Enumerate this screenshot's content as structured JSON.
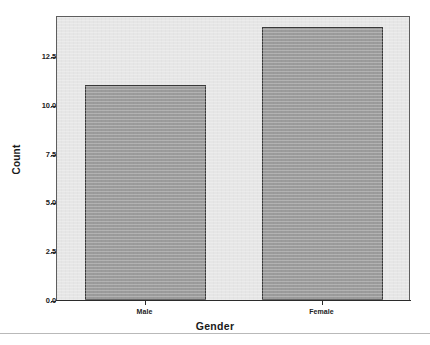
{
  "chart_data": {
    "type": "bar",
    "title": "",
    "subtitle": "",
    "categories": [
      "Male",
      "Female"
    ],
    "values": [
      11,
      14
    ],
    "xlabel": "Gender",
    "ylabel": "Count",
    "ylim": [
      0.0,
      14.6
    ],
    "yticks": [
      0.0,
      2.5,
      5.0,
      7.5,
      10.0,
      12.5
    ],
    "ytick_labels": [
      "0.0",
      "2.5",
      "5.0",
      "7.5",
      "10.0",
      "12.5"
    ],
    "grid": false,
    "legend": null,
    "annotations": [],
    "colors": {
      "bar_fill": "#9b9b9b",
      "bar_border": "#3a3a3a",
      "plot_background": "#e6e6e6",
      "plot_border": "#5e5e5e",
      "axis_text": "#222222",
      "page_background": "#ffffff",
      "footer_rule": "#b9b9b9"
    }
  },
  "axes": {
    "y_title": "Count",
    "x_title": "Gender"
  }
}
